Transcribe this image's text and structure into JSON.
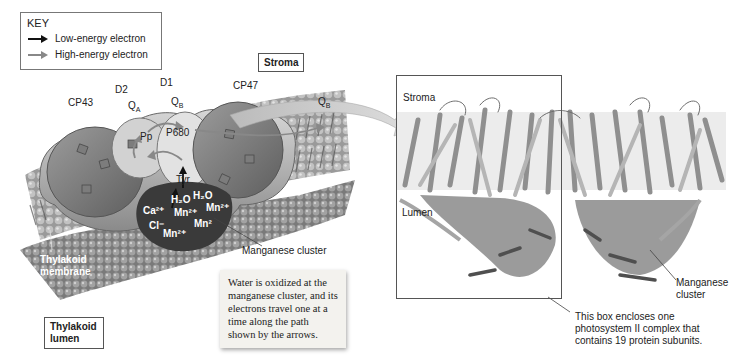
{
  "key": {
    "title": "KEY",
    "items": [
      {
        "label": "Low-energy electron",
        "arrow_color": "#111111"
      },
      {
        "label": "High-energy electron",
        "arrow_color": "#888888"
      }
    ]
  },
  "left_diagram": {
    "region_labels": {
      "stroma": "Stroma",
      "thylakoid_lumen": "Thylakoid lumen",
      "thylakoid_membrane": "Thylakoid membrane"
    },
    "subunits": [
      "CP43",
      "D2",
      "D1",
      "CP47"
    ],
    "cofactors": {
      "qa": "Q",
      "qa_sub": "A",
      "qb": "Q",
      "qb_sub": "B",
      "qb_out": "Q",
      "qb_out_sub": "B",
      "pp": "Pp",
      "p680": "P680",
      "tyr": "Tyr"
    },
    "cluster_ions": {
      "h2o_1": "H₂O",
      "h2o_2": "H₂O",
      "ca": "Ca²⁺",
      "cl": "Cl⁻",
      "mn_1": "Mn²⁺",
      "mn_2": "Mn²⁺",
      "mn_3": "Mn²",
      "mn_4": "Mn²⁺"
    },
    "manganese_label": "Manganese cluster",
    "note": "Water is oxidized at the manganese cluster, and its electrons travel one at a time along the path shown by the arrows."
  },
  "right_structure": {
    "stroma_label": "Stroma",
    "lumen_label": "Lumen",
    "manganese_label_line1": "Manganese",
    "manganese_label_line2": "cluster",
    "box_caption_line1": "This box encloses one",
    "box_caption_line2": "photosystem II complex that",
    "box_caption_line3": "contains 19 protein subunits."
  },
  "colors": {
    "membrane_dark": "#6b6b6b",
    "membrane_light": "#bdbdbd",
    "protein_fill": "#a9a9a9",
    "band": "#e9e9e9"
  }
}
